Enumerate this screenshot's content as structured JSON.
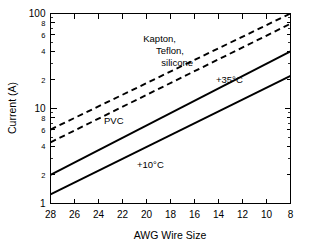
{
  "chart_data": {
    "type": "line",
    "title": "",
    "xlabel": "AWG Wire Size",
    "ylabel": "Current (A)",
    "xlim": [
      28,
      8
    ],
    "ylim": [
      1,
      100
    ],
    "yscale": "log",
    "xscale": "linear",
    "x_inverted": true,
    "grid": false,
    "legend": "none",
    "xticks": [
      28,
      26,
      24,
      22,
      20,
      18,
      16,
      14,
      12,
      10,
      8
    ],
    "xtick_labels": [
      "28",
      "26",
      "24",
      "22",
      "20",
      "18",
      "16",
      "14",
      "12",
      "10",
      "8"
    ],
    "yticks": [
      1,
      2,
      4,
      6,
      8,
      10,
      20,
      40,
      60,
      80,
      100
    ],
    "ytick_labels": [
      "1",
      "2",
      "4",
      "6",
      "8",
      "10",
      "2",
      "4",
      "6",
      "8",
      "100"
    ],
    "ytick_major": [
      "1",
      "10",
      "100"
    ],
    "series": [
      {
        "name": "Kapton, Teflon, silicone",
        "style": "dashed",
        "x": [
          28,
          8
        ],
        "values": [
          6.0,
          100.0
        ]
      },
      {
        "name": "PVC",
        "style": "dashed",
        "x": [
          28,
          8
        ],
        "values": [
          4.4,
          78.0
        ]
      },
      {
        "name": "+35°C",
        "style": "solid",
        "x": [
          28,
          8
        ],
        "values": [
          2.0,
          40.0
        ]
      },
      {
        "name": "+10°C",
        "style": "solid",
        "x": [
          28,
          8
        ],
        "values": [
          1.25,
          22.0
        ]
      }
    ],
    "annotations": [
      {
        "id": "insulation",
        "lines": [
          "Kapton,",
          "Teflon,",
          "silicone"
        ]
      },
      {
        "id": "pvc",
        "text": "PVC"
      },
      {
        "id": "temp-35",
        "text": "+35°C"
      },
      {
        "id": "temp-10",
        "text": "+10°C"
      }
    ]
  },
  "axes": {
    "x_title": "AWG Wire Size",
    "y_title": "Current (A)"
  },
  "colors": {
    "line": "#000000",
    "axis": "#000000",
    "background": "#ffffff"
  }
}
